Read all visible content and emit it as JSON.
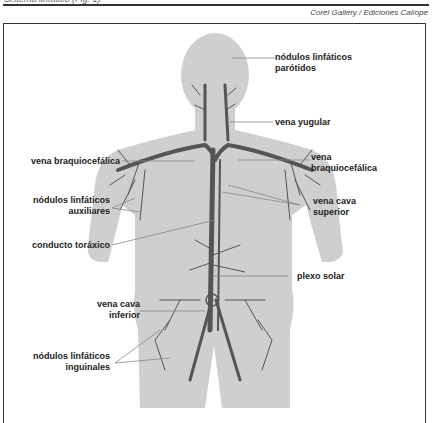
{
  "header": {
    "cut_title": "Sistema linfático (Fig. 1)",
    "credit": "Corel Gallery / Ediciones Calíope"
  },
  "figure": {
    "colors": {
      "body": "#cfcfcf",
      "vessels": "#555555",
      "leader": "#888888",
      "frame": "#333333"
    },
    "labels": {
      "parotidos": {
        "line1": "nódulos linfáticos",
        "line2": "parótidos"
      },
      "yugular": {
        "line1": "vena yugular"
      },
      "braq_left": {
        "line1": "vena braquiocefálica"
      },
      "braq_right": {
        "line1": "vena",
        "line2": "braquiocefálica"
      },
      "auxiliares": {
        "line1": "nódulos linfáticos",
        "line2": "auxiliares"
      },
      "cava_sup": {
        "line1": "vena cava",
        "line2": "superior"
      },
      "toraxico": {
        "line1": "conducto toráxico"
      },
      "plexo": {
        "line1": "plexo solar"
      },
      "cava_inf": {
        "line1": "vena cava",
        "line2": "inferior"
      },
      "inguinales": {
        "line1": "nódulos linfáticos",
        "line2": "inguinales"
      }
    }
  }
}
